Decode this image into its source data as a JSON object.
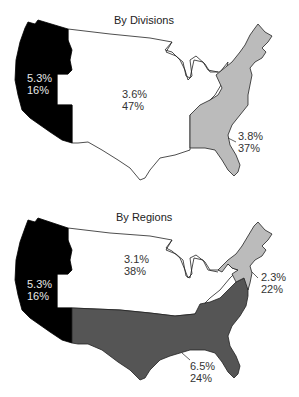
{
  "figure": {
    "cut_heading": "…growth by region…",
    "colors": {
      "west": "#000000",
      "central": "#ffffff",
      "east_division": "#bbbbbb",
      "northeast_region": "#bbbbbb",
      "south_region": "#555555",
      "outline": "#222222"
    }
  },
  "divisions_map": {
    "title": "By Divisions",
    "areas": [
      {
        "name": "West",
        "growth": "5.3%",
        "share": "16%"
      },
      {
        "name": "Central",
        "growth": "3.6%",
        "share": "47%"
      },
      {
        "name": "East",
        "growth": "3.8%",
        "share": "37%"
      }
    ]
  },
  "regions_map": {
    "title": "By Regions",
    "areas": [
      {
        "name": "West",
        "growth": "5.3%",
        "share": "16%"
      },
      {
        "name": "Midwest",
        "growth": "3.1%",
        "share": "38%"
      },
      {
        "name": "Northeast",
        "growth": "2.3%",
        "share": "22%"
      },
      {
        "name": "South",
        "growth": "6.5%",
        "share": "24%"
      }
    ]
  }
}
